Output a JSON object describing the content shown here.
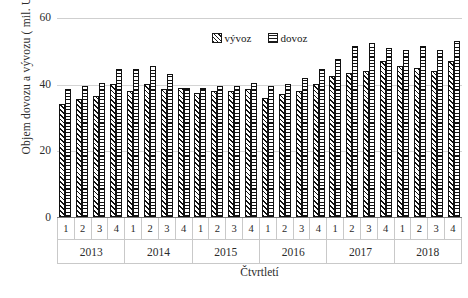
{
  "chart_data": {
    "type": "bar",
    "title": "",
    "xlabel": "Čtvrtletí",
    "ylabel": "Objem dovozu a vývozu ( mil. USD)",
    "ylim": [
      0,
      60
    ],
    "yticks": [
      0,
      20,
      40,
      60
    ],
    "grid": true,
    "legend_position": "top-center",
    "categories": [
      "1",
      "2",
      "3",
      "4",
      "1",
      "2",
      "3",
      "4",
      "1",
      "2",
      "3",
      "4",
      "1",
      "2",
      "3",
      "4",
      "1",
      "2",
      "3",
      "4",
      "1",
      "2",
      "3",
      "4"
    ],
    "groups": [
      {
        "label": "2013",
        "quarters": [
          "1",
          "2",
          "3",
          "4"
        ]
      },
      {
        "label": "2014",
        "quarters": [
          "1",
          "2",
          "3",
          "4"
        ]
      },
      {
        "label": "2015",
        "quarters": [
          "1",
          "2",
          "3",
          "4"
        ]
      },
      {
        "label": "2016",
        "quarters": [
          "1",
          "2",
          "3",
          "4"
        ]
      },
      {
        "label": "2017",
        "quarters": [
          "1",
          "2",
          "3",
          "4"
        ]
      },
      {
        "label": "2018",
        "quarters": [
          "1",
          "2",
          "3",
          "4"
        ]
      }
    ],
    "series": [
      {
        "name": "vývoz",
        "pattern": "diagonal-hatch",
        "color": "#111111",
        "values": [
          34.0,
          35.5,
          36.5,
          40.0,
          38.0,
          40.0,
          38.5,
          39.0,
          37.5,
          38.0,
          38.0,
          38.5,
          36.0,
          37.0,
          38.0,
          40.0,
          42.5,
          43.5,
          44.0,
          47.0,
          45.5,
          45.0,
          44.0,
          47.0
        ]
      },
      {
        "name": "dovoz",
        "pattern": "horizontal-lines",
        "color": "#111111",
        "values": [
          38.5,
          39.5,
          40.5,
          44.5,
          44.5,
          45.5,
          43.0,
          39.0,
          39.0,
          39.5,
          39.5,
          40.5,
          39.5,
          40.0,
          42.0,
          44.5,
          47.5,
          51.5,
          52.5,
          51.0,
          50.5,
          51.5,
          50.5,
          53.0
        ]
      }
    ]
  },
  "legend": {
    "items": [
      {
        "label": "vývoz",
        "swatch": "diagonal-hatch-swatch"
      },
      {
        "label": "dovoz",
        "swatch": "horizontal-lines-swatch"
      }
    ]
  },
  "axis": {
    "y_title": "Objem dovozu a vývozu ( mil. USD)",
    "x_title": "Čtvrtletí",
    "y_tick_labels": [
      "60",
      "40",
      "20",
      "0"
    ]
  }
}
